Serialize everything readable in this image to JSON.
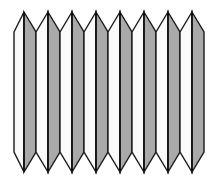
{
  "figure": {
    "type": "line-drawing",
    "caption": "",
    "canvas": {
      "width": 217,
      "height": 186,
      "background": "#ffffff"
    },
    "colors": {
      "background": "#ffffff",
      "face_shaded": "#a9a9a9",
      "face_light": "#fafafa",
      "outline": "#1a1a1a",
      "fold_line": "#111111"
    },
    "geometry": {
      "pleat_count": 8,
      "left_edge_x": 14,
      "right_edge_x": 204,
      "top_peak_y": 12,
      "top_valley_y": 32,
      "bottom_valley_y": 152,
      "bottom_point_y": 172,
      "peak_x": [
        24,
        48,
        72,
        96,
        120,
        144,
        168,
        192
      ],
      "valley_x": [
        14,
        36,
        60,
        84,
        108,
        132,
        156,
        180,
        204
      ],
      "outline_width": 1.4,
      "fold_line_width": 1.6
    },
    "pleats": [
      {
        "index": 1,
        "peak_x": 24,
        "left_valley_x": 14,
        "right_valley_x": 36,
        "left_face": "light",
        "right_face": "shaded"
      },
      {
        "index": 2,
        "peak_x": 48,
        "left_valley_x": 36,
        "right_valley_x": 60,
        "left_face": "light",
        "right_face": "shaded"
      },
      {
        "index": 3,
        "peak_x": 72,
        "left_valley_x": 60,
        "right_valley_x": 84,
        "left_face": "light",
        "right_face": "shaded"
      },
      {
        "index": 4,
        "peak_x": 96,
        "left_valley_x": 84,
        "right_valley_x": 108,
        "left_face": "light",
        "right_face": "shaded"
      },
      {
        "index": 5,
        "peak_x": 120,
        "left_valley_x": 108,
        "right_valley_x": 132,
        "left_face": "light",
        "right_face": "shaded"
      },
      {
        "index": 6,
        "peak_x": 144,
        "left_valley_x": 132,
        "right_valley_x": 156,
        "left_face": "light",
        "right_face": "shaded"
      },
      {
        "index": 7,
        "peak_x": 168,
        "left_valley_x": 156,
        "right_valley_x": 180,
        "left_face": "light",
        "right_face": "shaded"
      },
      {
        "index": 8,
        "peak_x": 192,
        "left_valley_x": 180,
        "right_valley_x": 204,
        "left_face": "light",
        "right_face": "shaded"
      }
    ],
    "labels": []
  }
}
